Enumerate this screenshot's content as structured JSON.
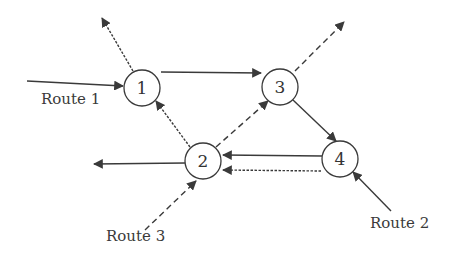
{
  "diagram": {
    "type": "network-routes",
    "nodes": [
      {
        "id": "1",
        "label": "1",
        "x": 142,
        "y": 88
      },
      {
        "id": "2",
        "label": "2",
        "x": 203,
        "y": 161
      },
      {
        "id": "3",
        "label": "3",
        "x": 280,
        "y": 87
      },
      {
        "id": "4",
        "label": "4",
        "x": 340,
        "y": 159
      }
    ],
    "node_radius": 18,
    "routes": [
      {
        "name": "Route 1",
        "style": "solid",
        "path": [
          "in",
          "1",
          "3",
          "4",
          "2",
          "out-left"
        ]
      },
      {
        "name": "Route 2",
        "style": "fine-dash",
        "path": [
          "in",
          "4",
          "2",
          "1",
          "out-top-left"
        ]
      },
      {
        "name": "Route 3",
        "style": "dashed",
        "path": [
          "in",
          "2",
          "3",
          "out-top-right"
        ]
      }
    ],
    "labels": {
      "route1": "Route 1",
      "route2": "Route 2",
      "route3": "Route 3"
    },
    "colors": {
      "line": "#3a3a3a",
      "text": "#333333",
      "background": "#ffffff"
    }
  }
}
